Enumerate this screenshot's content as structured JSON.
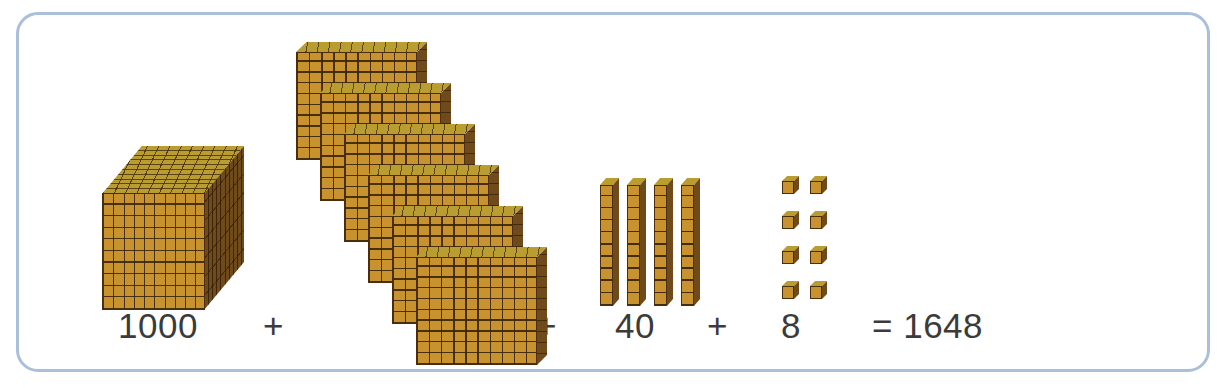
{
  "figure": {
    "title_visible": false,
    "frame_color": "#aabfda",
    "background_color": "#ffffff"
  },
  "palette": {
    "block_front": "#c8932e",
    "block_top": "#b99d30",
    "block_side": "#6f4b1c",
    "block_outline": "#4a2e0d",
    "text_color": "#3b3b3b"
  },
  "chart_data": {
    "type": "table",
    "xlabel": "",
    "ylabel": "",
    "categories": [
      "thousands",
      "hundreds",
      "tens",
      "ones"
    ],
    "values": [
      1000,
      600,
      40,
      8
    ],
    "series": [
      {
        "name": "block count",
        "values": [
          1,
          6,
          4,
          8
        ]
      },
      {
        "name": "place value",
        "values": [
          1000,
          100,
          10,
          1
        ]
      },
      {
        "name": "partial value",
        "values": [
          1000,
          600,
          40,
          8
        ]
      }
    ],
    "total": 1648,
    "annotations": [
      "1000 + 600 + 40 + 8 = 1648"
    ]
  },
  "equation": {
    "term_thousands": "1000",
    "plus_1": "+",
    "term_hundreds": "600",
    "plus_2": "+",
    "term_tens": "40",
    "plus_3": "+",
    "term_ones": "8",
    "result": "= 1648"
  },
  "blocks": {
    "thousand_cube": {
      "label": "thousand-cube",
      "count": 1,
      "value": 1000,
      "grid": "10x10x10"
    },
    "hundred_flats": {
      "label": "hundred-flat",
      "count": 6,
      "value": 600,
      "grid": "10x10"
    },
    "ten_rods": {
      "label": "ten-rod",
      "count": 4,
      "value": 40,
      "grid": "1x10"
    },
    "one_units": {
      "label": "one-unit",
      "count": 8,
      "value": 8,
      "grid": "1x1"
    }
  }
}
